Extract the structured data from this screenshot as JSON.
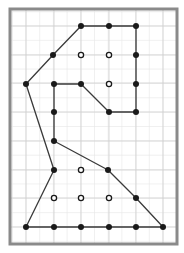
{
  "diagram": {
    "border": {
      "x": 10,
      "y": 9,
      "width": 167,
      "height": 235,
      "color": "#8a8a8a"
    },
    "grid": {
      "columns_x": [
        26,
        54,
        81,
        109,
        136,
        163
      ],
      "rows_y": [
        26,
        55,
        83,
        112,
        141,
        170,
        198,
        227
      ],
      "major_color": "#cfcfcf",
      "minor_color": "#e6e6e6"
    },
    "line_color": "#3a3a3a",
    "dot_color": "#1a1a1a",
    "outline_path": [
      [
        26,
        84
      ],
      [
        53,
        55
      ],
      [
        81,
        26
      ],
      [
        109,
        26
      ],
      [
        136,
        26
      ],
      [
        136,
        55
      ],
      [
        136,
        84
      ],
      [
        136,
        112
      ],
      [
        109,
        112
      ],
      [
        81,
        84
      ],
      [
        54,
        84
      ],
      [
        54,
        112
      ],
      [
        54,
        141
      ],
      [
        108,
        170
      ],
      [
        136,
        198
      ],
      [
        163,
        227
      ],
      [
        136,
        227
      ],
      [
        109,
        227
      ],
      [
        81,
        227
      ],
      [
        54,
        227
      ],
      [
        26,
        227
      ],
      [
        54,
        170
      ],
      [
        26,
        84
      ]
    ],
    "filled_dots": [
      [
        81,
        26
      ],
      [
        109,
        26
      ],
      [
        136,
        26
      ],
      [
        53,
        55
      ],
      [
        136,
        55
      ],
      [
        26,
        84
      ],
      [
        54,
        84
      ],
      [
        81,
        84
      ],
      [
        136,
        84
      ],
      [
        54,
        112
      ],
      [
        109,
        112
      ],
      [
        136,
        112
      ],
      [
        54,
        141
      ],
      [
        54,
        170
      ],
      [
        108,
        170
      ],
      [
        136,
        198
      ],
      [
        26,
        227
      ],
      [
        54,
        227
      ],
      [
        81,
        227
      ],
      [
        109,
        227
      ],
      [
        136,
        227
      ],
      [
        163,
        227
      ]
    ],
    "open_dots": [
      [
        81,
        55
      ],
      [
        109,
        55
      ],
      [
        109,
        84
      ],
      [
        81,
        170
      ],
      [
        54,
        198
      ],
      [
        81,
        198
      ],
      [
        109,
        198
      ]
    ]
  }
}
